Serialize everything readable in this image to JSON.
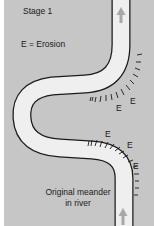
{
  "diagram": {
    "title": "Stage 1",
    "legend": "E = Erosion",
    "caption_line1": "Original meander",
    "caption_line2": "in river",
    "erosion_labels": [
      "E",
      "E",
      "E",
      "E",
      "E"
    ],
    "icons": {
      "flow_arrow_top": "arrow-up",
      "flow_arrow_bottom": "arrow-up"
    },
    "colors": {
      "background": "#c6c6c6",
      "river_fill": "#efefef",
      "river_outline": "#1a1a1a",
      "arrow": "#a8a8a8"
    }
  }
}
